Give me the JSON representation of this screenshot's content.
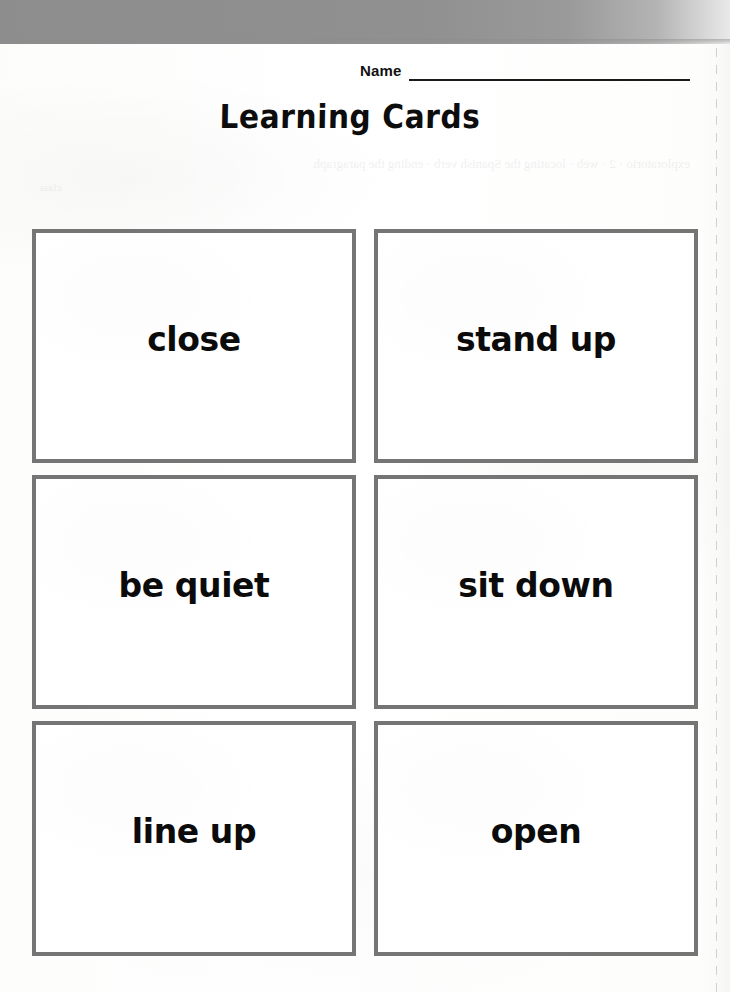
{
  "page": {
    "title": "Learning Cards",
    "background_color": "#fdfdfc",
    "scan_band_color": "#8d8d8d",
    "card_border_color": "#757575",
    "text_color": "#0b0b0b"
  },
  "name_field": {
    "label": "Name",
    "value": ""
  },
  "bleed_through": {
    "line_1": "exploratorio · 2 · web · locating the Spanish verb · ending the paragraph",
    "line_2": "class"
  },
  "cards": [
    {
      "label": "close"
    },
    {
      "label": "stand up"
    },
    {
      "label": "be quiet"
    },
    {
      "label": "sit down"
    },
    {
      "label": "line up"
    },
    {
      "label": "open"
    }
  ]
}
